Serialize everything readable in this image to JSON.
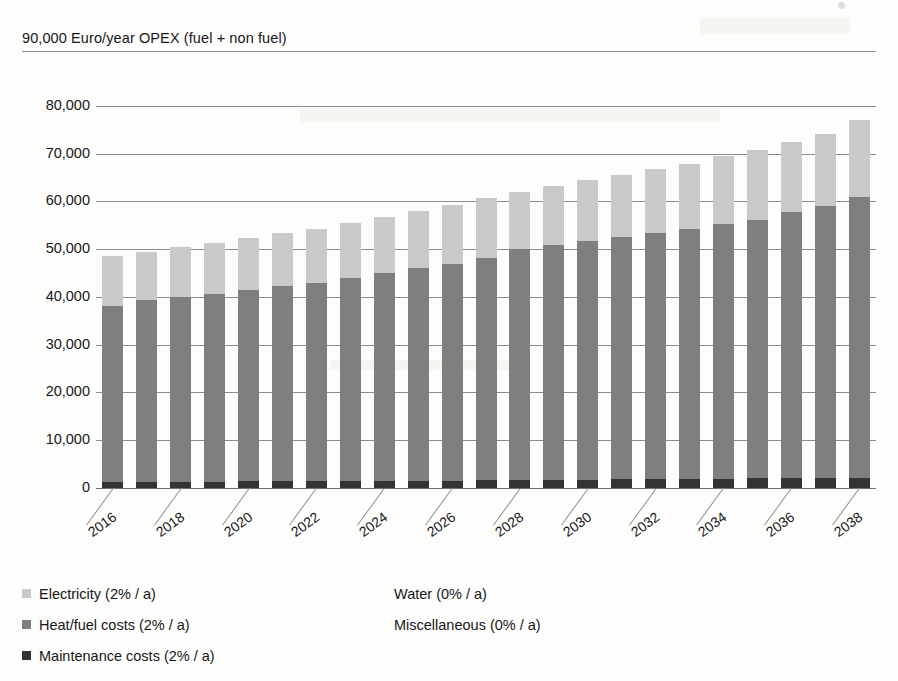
{
  "chart_data": {
    "type": "bar",
    "stacked": true,
    "title": "90,000 Euro/year OPEX (fuel + non fuel)",
    "xlabel": "",
    "ylabel": "Euro/year",
    "ylim": [
      0,
      90000
    ],
    "ytick_step": 10000,
    "grid": true,
    "legend_position": "bottom-left",
    "y_ticks": [
      "0",
      "10,000",
      "20,000",
      "30,000",
      "40,000",
      "50,000",
      "60,000",
      "70,000",
      "80,000",
      "90,000"
    ],
    "categories": [
      "2016",
      "2017",
      "2018",
      "2019",
      "2020",
      "2021",
      "2022",
      "2023",
      "2024",
      "2025",
      "2026",
      "2027",
      "2028",
      "2029",
      "2030",
      "2031",
      "2032",
      "2033",
      "2034",
      "2035",
      "2036",
      "2037",
      "2038"
    ],
    "x_tick_labels_shown": [
      "2016",
      "2018",
      "2020",
      "2022",
      "2024",
      "2026",
      "2028",
      "2030",
      "2032",
      "2034",
      "2036",
      "2038"
    ],
    "series": [
      {
        "name": "Maintenance costs (2% / a)",
        "color": "#333333",
        "values": [
          1300,
          1300,
          1350,
          1350,
          1400,
          1400,
          1450,
          1450,
          1500,
          1500,
          1550,
          1600,
          1650,
          1700,
          1750,
          1800,
          1850,
          1900,
          1950,
          2000,
          2050,
          2100,
          2150
        ]
      },
      {
        "name": "Heat/fuel costs (2% / a)",
        "color": "#7f7f7f",
        "values": [
          36700,
          38000,
          38700,
          39350,
          40100,
          40900,
          41500,
          42600,
          43500,
          44500,
          45400,
          46500,
          48400,
          49200,
          50050,
          50800,
          51550,
          52300,
          53250,
          54200,
          55700,
          56900,
          58850
        ]
      },
      {
        "name": "Electricity (2% / a)",
        "color": "#c9c9c9",
        "values": [
          10500,
          10200,
          10450,
          10600,
          10800,
          11000,
          11250,
          11450,
          11700,
          11900,
          12200,
          12500,
          11950,
          12300,
          12700,
          13000,
          13400,
          13700,
          14300,
          14600,
          14700,
          15100,
          16000
        ]
      },
      {
        "name": "Water (0% / a)",
        "color": "#a8a8a8",
        "values": [
          0,
          0,
          0,
          0,
          0,
          0,
          0,
          0,
          0,
          0,
          0,
          0,
          0,
          0,
          0,
          0,
          0,
          0,
          0,
          0,
          0,
          0,
          0
        ]
      },
      {
        "name": "Miscellaneous (0% / a)",
        "color": "#595959",
        "values": [
          0,
          0,
          0,
          0,
          0,
          0,
          0,
          0,
          0,
          0,
          0,
          0,
          0,
          0,
          0,
          0,
          0,
          0,
          0,
          0,
          0,
          0,
          0
        ]
      }
    ],
    "totals": [
      48500,
      49500,
      50500,
      51300,
      52300,
      53300,
      54200,
      55500,
      56700,
      57900,
      59150,
      60600,
      62000,
      63200,
      64500,
      65600,
      66800,
      67900,
      69500,
      70800,
      72450,
      74100,
      77000
    ]
  },
  "legend": {
    "left_column": [
      {
        "label": "Electricity (2% / a)",
        "swatch": "#c9c9c9",
        "has_swatch": true
      },
      {
        "label": "Heat/fuel costs (2% / a)",
        "swatch": "#7f7f7f",
        "has_swatch": true
      },
      {
        "label": "Maintenance costs (2% / a)",
        "swatch": "#333333",
        "has_swatch": true
      }
    ],
    "right_column": [
      {
        "label": "Water (0% / a)",
        "swatch": "#a8a8a8",
        "has_swatch": false
      },
      {
        "label": "Miscellaneous (0% / a)",
        "swatch": "#595959",
        "has_swatch": false
      }
    ]
  },
  "colors": {
    "electricity": "#c9c9c9",
    "heat_fuel": "#7f7f7f",
    "maintenance": "#333333",
    "water": "#a8a8a8",
    "miscellaneous": "#595959",
    "gridline": "#8d8d8d",
    "text": "#171717",
    "background": "#fdfdfc"
  }
}
